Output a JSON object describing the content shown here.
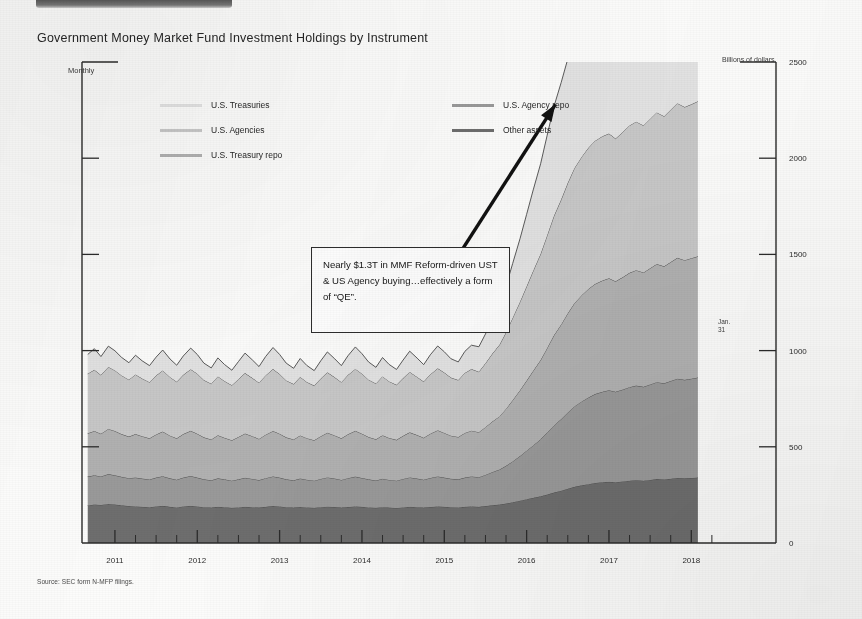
{
  "document": {
    "title": "Government Money Market Fund Investment Holdings by Instrument",
    "source_note": "Source: SEC form N-MFP filings.",
    "top_banner_name": "cropped-header-banner"
  },
  "chart_data": {
    "type": "area",
    "stacked": true,
    "title": "Government Money Market Fund Investment Holdings by Instrument",
    "frequency_label": "Monthly",
    "ylabel": "Billions of dollars",
    "xlabel": "",
    "ylim": [
      0,
      2500
    ],
    "xlim": [
      2010.6,
      2018.3
    ],
    "yticks": [
      0,
      500,
      1000,
      1500,
      2000,
      2500
    ],
    "ytick_labels": [
      "0",
      "500",
      "1000",
      "1500",
      "2000",
      "2500"
    ],
    "xticks": [
      2011,
      2012,
      2013,
      2014,
      2015,
      2016,
      2017,
      2018
    ],
    "xtick_labels": [
      "2011",
      "2012",
      "2013",
      "2014",
      "2015",
      "2016",
      "2017",
      "2018"
    ],
    "grid": false,
    "legend_position": "upper-left-and-upper-center",
    "endpoint_label": "Jan.\n31",
    "colors": {
      "other_assets": "#6e6e6e",
      "us_agency_repo": "#9a9a9a",
      "us_treasury_repo": "#b2b2b2",
      "us_agencies": "#c9c9c9",
      "us_treasuries": "#e4e4e4",
      "axis": "#2b2b2b",
      "series_outline": "#4a4a4a",
      "annotation_border": "#2d2d2d",
      "arrow": "#111111"
    },
    "x": [
      2010.67,
      2010.75,
      2010.83,
      2010.92,
      2011.0,
      2011.08,
      2011.17,
      2011.25,
      2011.33,
      2011.42,
      2011.5,
      2011.58,
      2011.67,
      2011.75,
      2011.83,
      2011.92,
      2012.0,
      2012.08,
      2012.17,
      2012.25,
      2012.33,
      2012.42,
      2012.5,
      2012.58,
      2012.67,
      2012.75,
      2012.83,
      2012.92,
      2013.0,
      2013.08,
      2013.17,
      2013.25,
      2013.33,
      2013.42,
      2013.5,
      2013.58,
      2013.67,
      2013.75,
      2013.83,
      2013.92,
      2014.0,
      2014.08,
      2014.17,
      2014.25,
      2014.33,
      2014.42,
      2014.5,
      2014.58,
      2014.67,
      2014.75,
      2014.83,
      2014.92,
      2015.0,
      2015.08,
      2015.17,
      2015.25,
      2015.33,
      2015.42,
      2015.5,
      2015.58,
      2015.67,
      2015.75,
      2015.83,
      2015.92,
      2016.0,
      2016.08,
      2016.17,
      2016.25,
      2016.33,
      2016.42,
      2016.5,
      2016.58,
      2016.67,
      2016.75,
      2016.83,
      2016.92,
      2017.0,
      2017.08,
      2017.17,
      2017.25,
      2017.33,
      2017.42,
      2017.5,
      2017.58,
      2017.67,
      2017.75,
      2017.83,
      2017.92,
      2018.0,
      2018.08
    ],
    "series": [
      {
        "name": "Other assets",
        "legend_label": "Other assets",
        "color": "#6e6e6e",
        "stack_order": 1,
        "values": [
          195,
          200,
          198,
          203,
          200,
          196,
          192,
          190,
          188,
          186,
          190,
          193,
          188,
          185,
          190,
          193,
          190,
          186,
          184,
          188,
          186,
          183,
          185,
          188,
          186,
          184,
          188,
          192,
          190,
          186,
          184,
          187,
          185,
          183,
          186,
          189,
          187,
          184,
          187,
          190,
          188,
          185,
          183,
          186,
          184,
          182,
          185,
          188,
          186,
          184,
          187,
          190,
          188,
          186,
          185,
          188,
          190,
          188,
          192,
          196,
          200,
          205,
          212,
          220,
          228,
          235,
          243,
          252,
          262,
          272,
          282,
          292,
          300,
          306,
          312,
          316,
          318,
          316,
          320,
          324,
          326,
          324,
          328,
          332,
          330,
          334,
          338,
          336,
          338,
          340
        ]
      },
      {
        "name": "U.S. Agency repo",
        "legend_label": "U.S. Agency repo",
        "color": "#9a9a9a",
        "stack_order": 2,
        "values": [
          150,
          152,
          148,
          155,
          152,
          148,
          145,
          150,
          147,
          144,
          150,
          154,
          148,
          144,
          150,
          155,
          150,
          145,
          142,
          148,
          145,
          141,
          146,
          151,
          147,
          143,
          149,
          154,
          150,
          145,
          142,
          148,
          144,
          141,
          147,
          152,
          148,
          144,
          150,
          155,
          150,
          146,
          142,
          148,
          144,
          142,
          148,
          153,
          149,
          145,
          151,
          156,
          152,
          148,
          146,
          152,
          156,
          154,
          162,
          172,
          182,
          196,
          212,
          232,
          252,
          272,
          296,
          322,
          348,
          372,
          396,
          418,
          436,
          450,
          462,
          470,
          476,
          470,
          478,
          486,
          492,
          488,
          496,
          504,
          500,
          508,
          516,
          512,
          516,
          520
        ]
      },
      {
        "name": "U.S. Treasury repo",
        "legend_label": "U.S. Treasury repo",
        "color": "#b2b2b2",
        "stack_order": 3,
        "values": [
          225,
          230,
          222,
          235,
          230,
          222,
          216,
          226,
          220,
          214,
          224,
          232,
          222,
          215,
          226,
          235,
          228,
          218,
          212,
          224,
          216,
          210,
          220,
          230,
          222,
          214,
          226,
          236,
          228,
          218,
          212,
          224,
          216,
          210,
          222,
          232,
          224,
          216,
          228,
          238,
          230,
          220,
          214,
          226,
          218,
          212,
          224,
          234,
          226,
          218,
          230,
          240,
          232,
          224,
          220,
          232,
          238,
          234,
          248,
          262,
          276,
          296,
          318,
          342,
          364,
          388,
          412,
          440,
          468,
          492,
          516,
          536,
          552,
          564,
          572,
          578,
          582,
          574,
          584,
          594,
          600,
          594,
          604,
          614,
          608,
          618,
          628,
          622,
          626,
          630
        ]
      },
      {
        "name": "U.S. Agencies",
        "legend_label": "U.S. Agencies",
        "color": "#c9c9c9",
        "stack_order": 4,
        "values": [
          310,
          318,
          305,
          322,
          315,
          305,
          296,
          310,
          300,
          292,
          306,
          318,
          304,
          294,
          308,
          320,
          312,
          298,
          290,
          306,
          295,
          286,
          300,
          314,
          302,
          292,
          308,
          322,
          310,
          296,
          288,
          304,
          292,
          284,
          300,
          314,
          302,
          292,
          308,
          322,
          312,
          298,
          290,
          306,
          294,
          286,
          300,
          314,
          302,
          292,
          308,
          322,
          314,
          302,
          296,
          312,
          320,
          314,
          332,
          352,
          372,
          398,
          428,
          460,
          490,
          520,
          552,
          586,
          620,
          650,
          678,
          702,
          720,
          734,
          744,
          750,
          752,
          742,
          754,
          766,
          772,
          764,
          776,
          788,
          780,
          792,
          804,
          796,
          800,
          806
        ]
      },
      {
        "name": "U.S. Treasuries",
        "legend_label": "U.S. Treasuries",
        "color": "#e4e4e4",
        "stack_order": 5,
        "values": [
          100,
          110,
          96,
          108,
          102,
          94,
          88,
          100,
          92,
          86,
          96,
          106,
          94,
          86,
          98,
          110,
          100,
          88,
          82,
          96,
          86,
          78,
          92,
          104,
          94,
          84,
          98,
          112,
          102,
          90,
          82,
          96,
          86,
          78,
          92,
          106,
          96,
          86,
          100,
          114,
          104,
          92,
          84,
          98,
          88,
          80,
          94,
          108,
          98,
          88,
          102,
          116,
          108,
          98,
          94,
          112,
          124,
          130,
          152,
          178,
          206,
          240,
          282,
          328,
          374,
          420,
          468,
          520,
          568,
          608,
          644,
          672,
          694,
          706,
          712,
          714,
          712,
          698,
          706,
          714,
          716,
          706,
          716,
          724,
          714,
          724,
          732,
          722,
          724,
          726
        ]
      }
    ],
    "annotations": [
      {
        "name": "mmf-reform-callout",
        "text": "Nearly $1.3T in MMF Reform-driven UST & US Agency buying…effectively a form of “QE”.",
        "box_x": 2014.05,
        "box_y": 1700,
        "arrow_from": [
          2015.0,
          1380
        ],
        "arrow_to": [
          2016.35,
          2280
        ]
      }
    ]
  },
  "legend": {
    "entries": [
      {
        "label": "U.S. Treasuries",
        "color": "#e4e4e4",
        "column": "left",
        "row": 0
      },
      {
        "label": "U.S. Agencies",
        "color": "#c9c9c9",
        "column": "left",
        "row": 1
      },
      {
        "label": "U.S. Treasury repo",
        "color": "#b2b2b2",
        "column": "left",
        "row": 2
      },
      {
        "label": "U.S. Agency repo",
        "color": "#9a9a9a",
        "column": "right",
        "row": 0
      },
      {
        "label": "Other assets",
        "color": "#6e6e6e",
        "column": "right",
        "row": 1
      }
    ]
  }
}
